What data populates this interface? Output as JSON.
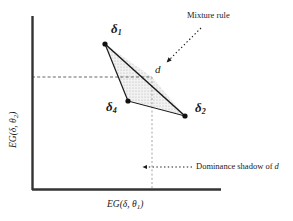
{
  "figure": {
    "title": "",
    "background_color": "#ffffff",
    "ink_color": "#1a1a1a",
    "shade_color": "#e8e8e8"
  },
  "axes": {
    "x_label_prefix": "EG(",
    "x_label": "EG(δ, θ",
    "x_label_sub": "1",
    "x_label_close": ")",
    "y_label": "EG(δ, θ",
    "y_label_sub": "2",
    "y_label_close": ")",
    "x_axis_color": "#333333",
    "y_axis_color": "#333333"
  },
  "points": [
    {
      "id": "delta1",
      "label": "δ",
      "sub": "1",
      "x": 105,
      "y": 44
    },
    {
      "id": "delta4",
      "label": "δ",
      "sub": "4",
      "x": 128,
      "y": 101
    },
    {
      "id": "delta2",
      "label": "δ",
      "sub": "2",
      "x": 185,
      "y": 116
    },
    {
      "id": "d",
      "label": "d",
      "sub": "",
      "x": 152,
      "y": 77
    }
  ],
  "annotations": {
    "mixture_rule": "Mixture rule",
    "dominance_shadow_prefix": "Dominance shadow of ",
    "dominance_shadow_italic": "d"
  }
}
